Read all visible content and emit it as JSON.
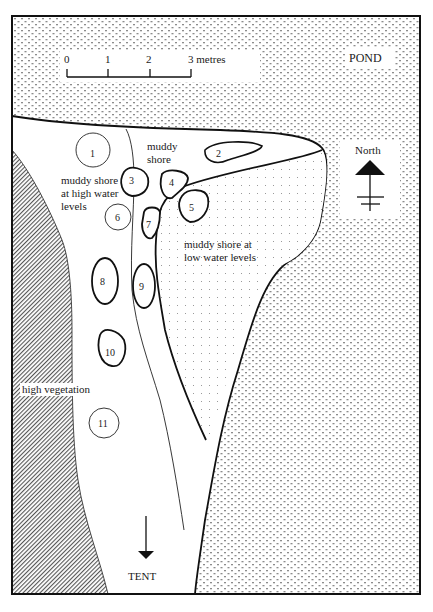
{
  "map": {
    "title": "",
    "scale_bar": {
      "ticks": [
        "0",
        "1",
        "2",
        "3 metres"
      ]
    },
    "labels": {
      "pond": "POND",
      "north": "North",
      "muddy_shore": [
        "muddy",
        "shore"
      ],
      "muddy_shore_high": [
        "muddy shore",
        "at high water",
        "levels"
      ],
      "muddy_shore_low": [
        "muddy shore at",
        "low water levels"
      ],
      "high_vegetation": "high vegetation",
      "tent": "TENT"
    },
    "sample_sites": [
      {
        "id": "1",
        "outline": "thin"
      },
      {
        "id": "2",
        "outline": "thick"
      },
      {
        "id": "3",
        "outline": "thick"
      },
      {
        "id": "4",
        "outline": "thick"
      },
      {
        "id": "5",
        "outline": "thick"
      },
      {
        "id": "6",
        "outline": "thin"
      },
      {
        "id": "7",
        "outline": "thick"
      },
      {
        "id": "8",
        "outline": "thick"
      },
      {
        "id": "9",
        "outline": "thick"
      },
      {
        "id": "10",
        "outline": "thick"
      },
      {
        "id": "11",
        "outline": "thin"
      }
    ],
    "legend_patterns": {
      "pond": "cross-dotted",
      "low_water_shore": "fine-dotted",
      "high_vegetation": "diagonal-hatch"
    },
    "colors": {
      "line": "#111111",
      "pattern": "#8a8a8a",
      "background": "#ffffff"
    }
  }
}
